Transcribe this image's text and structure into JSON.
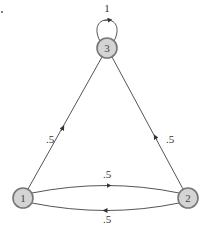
{
  "diagram": {
    "type": "markov-chain",
    "nodes": [
      {
        "id": "1",
        "label": "1",
        "x": 23,
        "y": 198
      },
      {
        "id": "2",
        "label": "2",
        "x": 188,
        "y": 198
      },
      {
        "id": "3",
        "label": "3",
        "x": 107,
        "y": 48
      }
    ],
    "edges": [
      {
        "from": "3",
        "to": "3",
        "label": "1"
      },
      {
        "from": "1",
        "to": "3",
        "label": ".5"
      },
      {
        "from": "2",
        "to": "3",
        "label": ".5"
      },
      {
        "from": "1",
        "to": "2",
        "label": ".5"
      },
      {
        "from": "2",
        "to": "1",
        "label": ".5"
      }
    ],
    "colors": {
      "node_fill": "#d4d4d4",
      "node_stroke": "#777777",
      "edge": "#555555"
    }
  }
}
